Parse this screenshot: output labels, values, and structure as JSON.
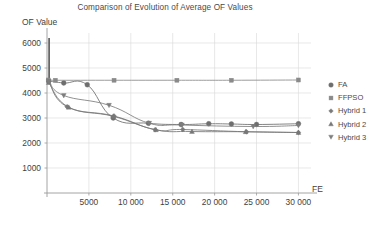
{
  "chart_data": {
    "type": "line",
    "title": "Comparison of Evolution of Average OF Values",
    "xlabel": "FE",
    "ylabel": "OF Value",
    "xlim": [
      0,
      31500
    ],
    "ylim": [
      0,
      6400
    ],
    "grid": true,
    "legend_position": "right",
    "xticks": [
      5000,
      10000,
      15000,
      20000,
      25000,
      30000
    ],
    "xtick_labels": [
      "5000",
      "10 000",
      "15 000",
      "20 000",
      "25 000",
      "30 000"
    ],
    "yticks": [
      1000,
      2000,
      3000,
      4000,
      5000,
      6000
    ],
    "ytick_labels": [
      "1000",
      "2000",
      "3000",
      "4000",
      "5000",
      "6000"
    ],
    "series": [
      {
        "name": "FA",
        "marker": "circle",
        "color": "#6e6e6e",
        "x": [
          200,
          2000,
          4800,
          7900,
          12100,
          16000,
          19300,
          22000,
          25000,
          30000
        ],
        "values": [
          4480,
          4400,
          4330,
          3000,
          2790,
          2740,
          2770,
          2760,
          2740,
          2770
        ]
      },
      {
        "name": "FFPSO",
        "marker": "square",
        "color": "#8a8a8a",
        "x": [
          150,
          1000,
          8000,
          15500,
          22000,
          30000
        ],
        "values": [
          4520,
          4510,
          4510,
          4510,
          4510,
          4520
        ]
      },
      {
        "name": "Hybrid 1",
        "marker": "diamond",
        "color": "#7a7a7a",
        "x": [
          200,
          2400,
          8000,
          12900,
          16200,
          23800,
          30000
        ],
        "values": [
          4450,
          3450,
          3080,
          2530,
          2540,
          2450,
          2420
        ]
      },
      {
        "name": "Hybrid 2",
        "marker": "triangle-up",
        "color": "#777777",
        "x": [
          200,
          2600,
          7900,
          13000,
          17300,
          23700,
          30000
        ],
        "values": [
          4420,
          3430,
          3070,
          2530,
          2460,
          2450,
          2420
        ]
      },
      {
        "name": "Hybrid 3",
        "marker": "triangle-down",
        "color": "#7d7d7d",
        "x": [
          200,
          2000,
          7400,
          12200,
          16100,
          24600,
          30000
        ],
        "values": [
          4470,
          3900,
          3510,
          2790,
          2720,
          2660,
          2700
        ]
      }
    ],
    "annotations": [
      {
        "label": "left-edge-spike",
        "x": 250,
        "y_top": 6200,
        "y_bottom": 4500
      }
    ]
  },
  "axes": {
    "y_axis_title": "OF Value",
    "x_axis_title": "FE"
  },
  "legend": {
    "entries": [
      {
        "label": "FA",
        "marker": "circle"
      },
      {
        "label": "FFPSO",
        "marker": "square"
      },
      {
        "label": "Hybrid 1",
        "marker": "diamond"
      },
      {
        "label": "Hybrid 2",
        "marker": "triangle-up"
      },
      {
        "label": "Hybrid 3",
        "marker": "triangle-down"
      }
    ]
  },
  "colors": {
    "grid": "#d8d8d8",
    "axis": "#9a9a9a",
    "text": "#3f3f3f",
    "plot_bg": "#ffffff"
  }
}
